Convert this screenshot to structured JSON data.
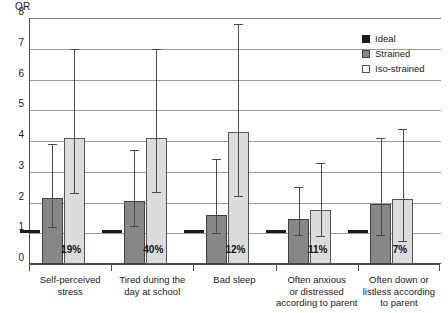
{
  "chart_data": {
    "type": "bar",
    "title": "",
    "ylabel": "OR",
    "xlabel": "",
    "ylim": [
      0,
      8
    ],
    "yticks": [
      0,
      1,
      2,
      3,
      4,
      5,
      6,
      7,
      8
    ],
    "grid": true,
    "legend_position": "top-right",
    "reference_line": 1,
    "categories": [
      "Self-perceived stress",
      "Tired during the day at school",
      "Bad sleep",
      "Often anxious or distressed according to parent",
      "Often down or listless according to parent"
    ],
    "category_lines": [
      [
        "Self-perceived",
        "stress"
      ],
      [
        "Tired during the",
        "day at school"
      ],
      [
        "Bad sleep"
      ],
      [
        "Often anxious",
        "or distressed",
        "according to parent"
      ],
      [
        "Often down or",
        "listless according",
        "to parent"
      ]
    ],
    "prevalence_labels": [
      "19%",
      "40%",
      "12%",
      "11%",
      "7%"
    ],
    "series": [
      {
        "name": "Ideal",
        "color": "#1a1a1a",
        "values": [
          1.0,
          1.0,
          1.0,
          1.0,
          1.0
        ],
        "ci_low": [
          null,
          null,
          null,
          null,
          null
        ],
        "ci_high": [
          null,
          null,
          null,
          null,
          null
        ]
      },
      {
        "name": "Strained",
        "color": "#878787",
        "values": [
          2.15,
          2.05,
          1.6,
          1.45,
          1.95
        ],
        "ci_low": [
          1.2,
          1.25,
          1.0,
          0.95,
          0.95
        ],
        "ci_high": [
          3.9,
          3.7,
          3.4,
          2.5,
          4.1
        ]
      },
      {
        "name": "Iso-strained",
        "color": "#dcdcdc",
        "values": [
          4.1,
          4.1,
          4.3,
          1.75,
          2.1
        ],
        "ci_low": [
          2.3,
          2.35,
          2.2,
          0.9,
          0.75
        ],
        "ci_high": [
          7.0,
          7.0,
          7.8,
          3.3,
          4.4
        ]
      }
    ]
  },
  "legend": {
    "items": [
      {
        "label": "Ideal",
        "swatch": "ideal"
      },
      {
        "label": "Strained",
        "swatch": "strained"
      },
      {
        "label": "Iso-strained",
        "swatch": "iso"
      }
    ]
  },
  "axis": {
    "y_title": "OR"
  }
}
